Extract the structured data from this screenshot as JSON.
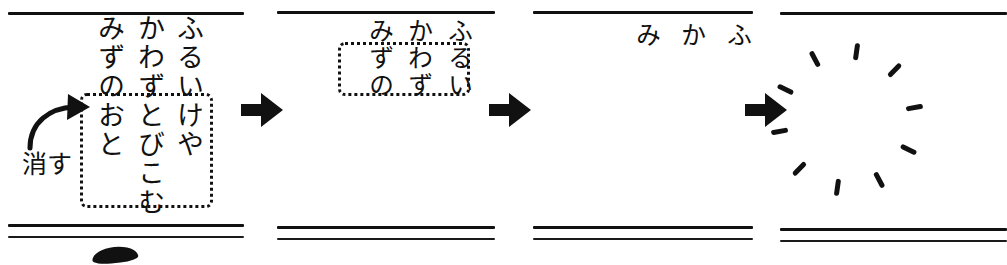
{
  "figure": {
    "ink_color": "#111111",
    "background": "#ffffff",
    "panel_count": 4
  },
  "annotation": {
    "erase_label": "消す",
    "arrow_icon": "curved-arrow-icon"
  },
  "arrows": {
    "icon": "block-arrow-right-icon",
    "label": "→",
    "count": 3
  },
  "panels": [
    {
      "id": "panel-1",
      "state": "full-haiku",
      "columns": [
        "ふるいけや",
        "かわずとびこむ",
        "みずのおと"
      ],
      "selection_box": true
    },
    {
      "id": "panel-2",
      "state": "partially-erased",
      "columns": [
        "ふるい",
        "かわず",
        "みずの"
      ],
      "selection_box": true
    },
    {
      "id": "panel-3",
      "state": "mostly-erased",
      "columns": [
        "ふ",
        "か",
        "み"
      ],
      "selection_box": false
    },
    {
      "id": "panel-4",
      "state": "fully-erased",
      "columns": [],
      "selection_box": false,
      "burst_icon": "sparkle-burst-icon",
      "burst_spark_count": 10
    }
  ],
  "rules": {
    "top": [
      {
        "left": 8,
        "width": 236
      },
      {
        "left": 277,
        "width": 218
      },
      {
        "left": 533,
        "width": 220
      },
      {
        "left": 780,
        "width": 227
      }
    ],
    "bottom_upper": [
      {
        "left": 8,
        "width": 236
      },
      {
        "left": 277,
        "width": 218
      },
      {
        "left": 533,
        "width": 220
      },
      {
        "left": 780,
        "width": 227
      }
    ],
    "bottom_lower": [
      {
        "left": 8,
        "width": 236
      },
      {
        "left": 277,
        "width": 218
      },
      {
        "left": 533,
        "width": 220
      },
      {
        "left": 780,
        "width": 227
      }
    ]
  }
}
